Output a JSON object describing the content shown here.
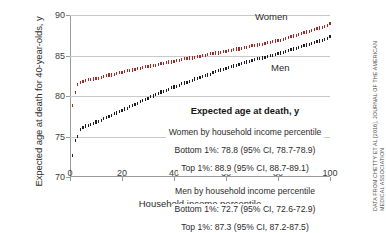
{
  "chart_data": {
    "type": "scatter",
    "title": "",
    "xlabel": "Household income percentile",
    "ylabel": "Expected age at death for 40-year-olds, y",
    "xlim": [
      0,
      100
    ],
    "ylim": [
      70,
      90
    ],
    "xticks": [
      "0",
      "20",
      "40",
      "60",
      "80",
      "100"
    ],
    "yticks": [
      "70",
      "75",
      "80",
      "85",
      "90"
    ],
    "grid": true,
    "legend_position": "inside-center-right",
    "series": [
      {
        "name": "Women",
        "color": "#9e2b28",
        "x": [
          1,
          2,
          3,
          4,
          5,
          6,
          7,
          8,
          9,
          10,
          11,
          12,
          13,
          14,
          15,
          16,
          17,
          18,
          19,
          20,
          21,
          22,
          23,
          24,
          25,
          26,
          27,
          28,
          29,
          30,
          31,
          32,
          33,
          34,
          35,
          36,
          37,
          38,
          39,
          40,
          41,
          42,
          43,
          44,
          45,
          46,
          47,
          48,
          49,
          50,
          51,
          52,
          53,
          54,
          55,
          56,
          57,
          58,
          59,
          60,
          61,
          62,
          63,
          64,
          65,
          66,
          67,
          68,
          69,
          70,
          71,
          72,
          73,
          74,
          75,
          76,
          77,
          78,
          79,
          80,
          81,
          82,
          83,
          84,
          85,
          86,
          87,
          88,
          89,
          90,
          91,
          92,
          93,
          94,
          95,
          96,
          97,
          98,
          99,
          100
        ],
        "values": [
          78.8,
          80.4,
          81.4,
          81.7,
          81.8,
          81.9,
          82.0,
          82.0,
          82.1,
          82.2,
          82.2,
          82.3,
          82.4,
          82.5,
          82.6,
          82.6,
          82.7,
          82.8,
          82.9,
          82.9,
          83.0,
          83.1,
          83.1,
          83.2,
          83.3,
          83.4,
          83.4,
          83.5,
          83.6,
          83.6,
          83.7,
          83.8,
          83.8,
          83.9,
          84.0,
          84.0,
          84.1,
          84.2,
          84.2,
          84.3,
          84.4,
          84.4,
          84.5,
          84.6,
          84.6,
          84.7,
          84.7,
          84.8,
          84.9,
          84.9,
          85.0,
          85.0,
          85.1,
          85.2,
          85.2,
          85.3,
          85.3,
          85.4,
          85.5,
          85.5,
          85.6,
          85.6,
          85.7,
          85.8,
          85.8,
          85.9,
          86.0,
          86.0,
          86.1,
          86.2,
          86.2,
          86.3,
          86.4,
          86.4,
          86.5,
          86.6,
          86.6,
          86.7,
          86.8,
          86.9,
          86.9,
          87.0,
          87.1,
          87.2,
          87.3,
          87.4,
          87.5,
          87.6,
          87.7,
          87.8,
          87.9,
          88.0,
          88.1,
          88.2,
          88.3,
          88.4,
          88.5,
          88.6,
          88.7,
          88.9
        ]
      },
      {
        "name": "Men",
        "color": "#1d1d1d",
        "x": [
          1,
          2,
          3,
          4,
          5,
          6,
          7,
          8,
          9,
          10,
          11,
          12,
          13,
          14,
          15,
          16,
          17,
          18,
          19,
          20,
          21,
          22,
          23,
          24,
          25,
          26,
          27,
          28,
          29,
          30,
          31,
          32,
          33,
          34,
          35,
          36,
          37,
          38,
          39,
          40,
          41,
          42,
          43,
          44,
          45,
          46,
          47,
          48,
          49,
          50,
          51,
          52,
          53,
          54,
          55,
          56,
          57,
          58,
          59,
          60,
          61,
          62,
          63,
          64,
          65,
          66,
          67,
          68,
          69,
          70,
          71,
          72,
          73,
          74,
          75,
          76,
          77,
          78,
          79,
          80,
          81,
          82,
          83,
          84,
          85,
          86,
          87,
          88,
          89,
          90,
          91,
          92,
          93,
          94,
          95,
          96,
          97,
          98,
          99,
          100
        ],
        "values": [
          72.7,
          74.5,
          75.0,
          75.9,
          76.1,
          76.3,
          76.4,
          76.5,
          76.6,
          76.8,
          76.9,
          77.0,
          77.2,
          77.3,
          77.5,
          77.6,
          77.8,
          77.9,
          78.1,
          78.2,
          78.4,
          78.5,
          78.7,
          78.8,
          79.0,
          79.1,
          79.3,
          79.4,
          79.6,
          79.7,
          79.9,
          80.0,
          80.2,
          80.3,
          80.5,
          80.6,
          80.7,
          80.8,
          81.0,
          81.1,
          81.2,
          81.3,
          81.5,
          81.6,
          81.7,
          81.8,
          81.9,
          82.1,
          82.2,
          82.3,
          82.4,
          82.5,
          82.6,
          82.7,
          82.9,
          83.0,
          83.1,
          83.2,
          83.3,
          83.4,
          83.5,
          83.6,
          83.7,
          83.8,
          83.9,
          84.0,
          84.1,
          84.2,
          84.3,
          84.4,
          84.5,
          84.6,
          84.6,
          84.7,
          84.8,
          84.9,
          85.0,
          85.0,
          85.1,
          85.2,
          85.3,
          85.4,
          85.5,
          85.6,
          85.7,
          85.8,
          85.9,
          86.0,
          86.1,
          86.2,
          86.3,
          86.4,
          86.5,
          86.6,
          86.7,
          86.8,
          86.9,
          87.0,
          87.1,
          87.3
        ]
      }
    ],
    "annotations": {
      "women_label": "Women",
      "men_label": "Men"
    }
  },
  "legend": {
    "title": "Expected age at death, y",
    "women": {
      "heading": "Women by household income percentile",
      "bottom": "Bottom 1%: 78.8 (95% CI, 78.7-78.9)",
      "top": "Top 1%: 88.9 (95% CI, 88.7-89.1)"
    },
    "men": {
      "heading": "Men by household income percentile",
      "bottom": "Bottom 1%: 72.7 (95% CI, 72.6-72.9)",
      "top": "Top 1%: 87.3 (95% CI, 87.2-87.5)"
    }
  },
  "credit": {
    "line1": "DATA FROM CHETTY ET AL [2016], JOURNAL OF THE AMERICAN",
    "line2": "MEDICAL ASSOCIATION"
  }
}
